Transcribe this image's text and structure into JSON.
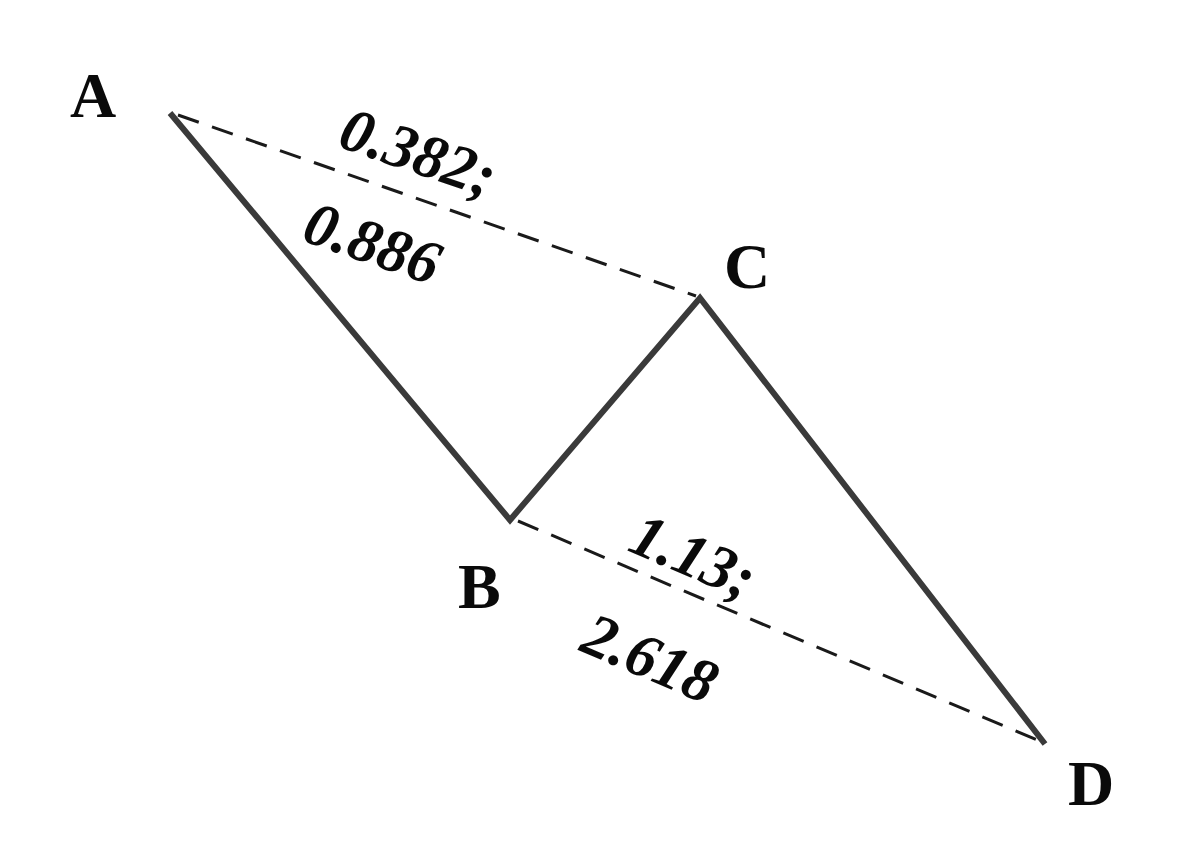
{
  "diagram": {
    "type": "harmonic-pattern",
    "points": {
      "A": {
        "label": "A",
        "x": 170,
        "y": 113
      },
      "B": {
        "label": "B",
        "x": 510,
        "y": 520
      },
      "C": {
        "label": "C",
        "x": 700,
        "y": 298
      },
      "D": {
        "label": "D",
        "x": 1045,
        "y": 744
      }
    },
    "legs": [
      "A-B",
      "B-C",
      "C-D"
    ],
    "ratio_lines": [
      {
        "from": "A",
        "to": "C",
        "line1": "0.382;",
        "line2": "0.886"
      },
      {
        "from": "B",
        "to": "D",
        "line1": "1.13;",
        "line2": "2.618"
      }
    ],
    "colors": {
      "leg": "#3a3a3a",
      "dashed": "#1a1a1a",
      "text": "#0a0a0a",
      "background": "#ffffff"
    }
  }
}
